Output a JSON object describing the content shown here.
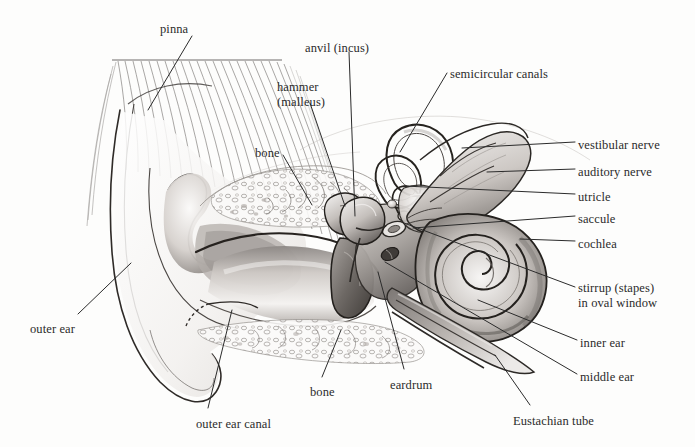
{
  "figure": {
    "medium": "pencil drawing",
    "background_color": "#fdfdfc",
    "ink_color": "#2b2b2b",
    "width": 695,
    "height": 447
  },
  "labels": [
    {
      "id": "pinna",
      "text": "pinna",
      "x": 160,
      "y": 22,
      "align": "left"
    },
    {
      "id": "anvil-incus",
      "text": "anvil (incus)",
      "x": 305,
      "y": 41,
      "align": "left"
    },
    {
      "id": "hammer-malleus",
      "text": "hammer\n(malleus)",
      "x": 277,
      "y": 80,
      "align": "left"
    },
    {
      "id": "semicircular",
      "text": "semicircular canals",
      "x": 450,
      "y": 67,
      "align": "left"
    },
    {
      "id": "bone-upper",
      "text": "bone",
      "x": 255,
      "y": 146,
      "align": "left"
    },
    {
      "id": "vestibular-nerve",
      "text": "vestibular nerve",
      "x": 578,
      "y": 138,
      "align": "left"
    },
    {
      "id": "auditory-nerve",
      "text": "auditory nerve",
      "x": 578,
      "y": 165,
      "align": "left"
    },
    {
      "id": "utricle",
      "text": "utricle",
      "x": 578,
      "y": 190,
      "align": "left"
    },
    {
      "id": "saccule",
      "text": "saccule",
      "x": 578,
      "y": 212,
      "align": "left"
    },
    {
      "id": "cochlea",
      "text": "cochlea",
      "x": 578,
      "y": 237,
      "align": "left"
    },
    {
      "id": "stirrup-stapes",
      "text": "stirrup (stapes)\nin oval window",
      "x": 578,
      "y": 281,
      "align": "left"
    },
    {
      "id": "inner-ear",
      "text": "inner ear",
      "x": 580,
      "y": 336,
      "align": "left"
    },
    {
      "id": "middle-ear",
      "text": "middle ear",
      "x": 580,
      "y": 370,
      "align": "left"
    },
    {
      "id": "outer-ear",
      "text": "outer ear",
      "x": 30,
      "y": 322,
      "align": "left"
    },
    {
      "id": "outer-ear-canal",
      "text": "outer ear canal",
      "x": 196,
      "y": 417,
      "align": "left"
    },
    {
      "id": "bone-lower",
      "text": "bone",
      "x": 310,
      "y": 385,
      "align": "left"
    },
    {
      "id": "eardrum",
      "text": "eardrum",
      "x": 390,
      "y": 378,
      "align": "left"
    },
    {
      "id": "eustachian-tube",
      "text": "Eustachian tube",
      "x": 513,
      "y": 414,
      "align": "left"
    }
  ],
  "leaders": [
    {
      "id": "leader-pinna",
      "points": "192,36 148,110"
    },
    {
      "id": "leader-anvil",
      "points": "349,52 355,216"
    },
    {
      "id": "leader-hammer",
      "points": "310,103 345,206"
    },
    {
      "id": "leader-semicircular",
      "points": "447,73 400,152"
    },
    {
      "id": "leader-bone-upper",
      "points": "283,155 312,205"
    },
    {
      "id": "leader-vestibular",
      "points": "575,142 462,148"
    },
    {
      "id": "leader-auditory",
      "points": "575,169 487,172"
    },
    {
      "id": "leader-utricle",
      "points": "575,194 404,186"
    },
    {
      "id": "leader-saccule",
      "points": "575,216 413,228"
    },
    {
      "id": "leader-cochlea",
      "points": "575,241 520,239"
    },
    {
      "id": "leader-stapes",
      "points": "575,287 404,223"
    },
    {
      "id": "leader-inner-ear",
      "points": "577,340 478,300"
    },
    {
      "id": "leader-middle-ear",
      "points": "577,374 385,262"
    },
    {
      "id": "leader-outer-ear",
      "points": "78,314 131,263"
    },
    {
      "id": "leader-outer-ear-canal",
      "points": "208,408 232,310"
    },
    {
      "id": "leader-bone-lower",
      "points": "322,377 341,330"
    },
    {
      "id": "leader-eardrum",
      "points": "404,369 378,272"
    },
    {
      "id": "leader-eustachian",
      "points": "530,405 495,355"
    }
  ],
  "anatomy_parts": [
    "pinna",
    "outer ear",
    "outer ear canal",
    "eardrum",
    "hammer (malleus)",
    "anvil (incus)",
    "stirrup (stapes) in oval window",
    "semicircular canals",
    "utricle",
    "saccule",
    "cochlea",
    "vestibular nerve",
    "auditory nerve",
    "Eustachian tube",
    "bone"
  ]
}
